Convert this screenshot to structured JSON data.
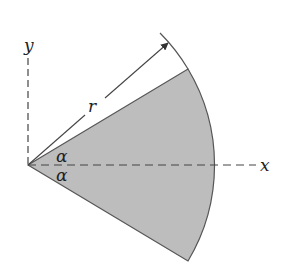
{
  "diagram": {
    "labels": {
      "x_axis": "x",
      "y_axis": "y",
      "radius": "r",
      "angle_upper": "α",
      "angle_lower": "α"
    },
    "colors": {
      "sector_fill": "#bdbdbd",
      "stroke": "#444444",
      "text": "#222222"
    },
    "geometry": {
      "origin": [
        28,
        165
      ],
      "radius_px": 187,
      "half_angle_deg": 31
    }
  }
}
